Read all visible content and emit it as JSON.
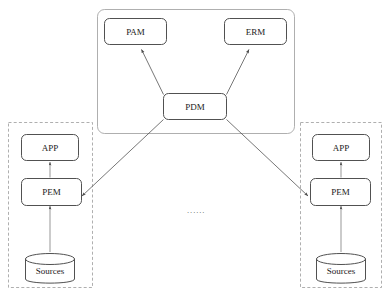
{
  "diagram": {
    "background_color": "#ffffff",
    "stroke_color": "#3d3d3d",
    "container_stroke_color": "#9a9a9a",
    "platform_container": {
      "name": "platform-container",
      "style": "rounded-solid-rectangle"
    },
    "nodes": {
      "pam": "PAM",
      "erm": "ERM",
      "pdm": "PDM",
      "app_left": "APP",
      "pem_left": "PEM",
      "sources_left": "Sources",
      "app_right": "APP",
      "pem_right": "PEM",
      "sources_right": "Sources"
    },
    "groups": {
      "left": {
        "name": "site-group-left",
        "style": "dashed-rectangle"
      },
      "right": {
        "name": "site-group-right",
        "style": "dashed-rectangle"
      }
    },
    "ellipsis": "······",
    "edges": [
      {
        "from": "PDM",
        "to": "PAM",
        "arrow": true
      },
      {
        "from": "PDM",
        "to": "ERM",
        "arrow": true
      },
      {
        "from": "PDM",
        "to": "PEM (left)",
        "arrow": true
      },
      {
        "from": "PDM",
        "to": "PEM (right)",
        "arrow": true
      },
      {
        "from": "PEM (left)",
        "to": "APP (left)",
        "arrow": true
      },
      {
        "from": "Sources (left)",
        "to": "PEM (left)",
        "arrow": true
      },
      {
        "from": "PEM (right)",
        "to": "APP (right)",
        "arrow": true
      },
      {
        "from": "Sources (right)",
        "to": "PEM (right)",
        "arrow": true
      }
    ],
    "caption": ""
  }
}
